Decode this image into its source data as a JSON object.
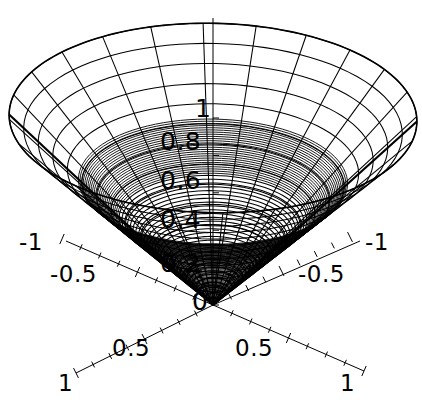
{
  "figure": {
    "kind": "mathematica-3d-surface-plot",
    "background_color": "#ffffff",
    "line_color": "#000000",
    "width": 422,
    "height": 405
  },
  "chart_data": {
    "type": "line",
    "plot_style": "3d-wireframe-surface",
    "title": "",
    "subtitle": "",
    "surface": {
      "description": "Upward-opening circular cone wireframe, apex at origin, z = sqrt(x^2 + y^2)",
      "equation": "z = sqrt(x^2 + y^2)",
      "mesh_radial_lines": 24,
      "mesh_rings": 14,
      "apex": [
        0,
        0,
        0
      ],
      "rim_radius": 1,
      "rim_height": 1
    },
    "xlabel": "",
    "ylabel": "",
    "zlabel": "",
    "grid": false,
    "legend": false,
    "axes": [
      {
        "name": "x-axis",
        "orientation": "lower-left-to-upper-right",
        "ticks": [
          {
            "value": "-1",
            "label": "-1"
          },
          {
            "value": "-0.5",
            "label": "-0.5"
          },
          {
            "value": "0",
            "label": "0"
          },
          {
            "value": "0.5",
            "label": "0.5"
          },
          {
            "value": "1",
            "label": "1"
          }
        ],
        "minor_ticks_per_interval": 4,
        "range": [
          -1,
          1
        ]
      },
      {
        "name": "y-axis",
        "orientation": "lower-right-to-upper-left",
        "ticks": [
          {
            "value": "-1",
            "label": "-1"
          },
          {
            "value": "-0.5",
            "label": "-0.5"
          },
          {
            "value": "0",
            "label": "0"
          },
          {
            "value": "0.5",
            "label": "0.5"
          },
          {
            "value": "1",
            "label": "1"
          }
        ],
        "minor_ticks_per_interval": 4,
        "range": [
          -1,
          1
        ]
      },
      {
        "name": "z-axis",
        "orientation": "vertical",
        "ticks": [
          {
            "value": "0",
            "label": "0"
          },
          {
            "value": "0.2",
            "label": "0.2"
          },
          {
            "value": "0.4",
            "label": "0.4"
          },
          {
            "value": "0.6",
            "label": "0.6"
          },
          {
            "value": "0.8",
            "label": "0.8"
          },
          {
            "value": "1",
            "label": "1"
          }
        ],
        "range": [
          0,
          1
        ]
      }
    ]
  },
  "labels": {
    "z": {
      "t1": "1",
      "t08": "0.8",
      "t06": "0.6",
      "t04": "0.4",
      "t02": "0.2",
      "t0": "0"
    },
    "left_back": {
      "neg1": "-1",
      "neg05": "-0.5"
    },
    "left_front": {
      "p05": "0.5",
      "p1": "1"
    },
    "right_back": {
      "neg1": "-1",
      "neg05": "-0.5"
    },
    "right_front": {
      "p05": "0.5",
      "p1": "1"
    }
  }
}
